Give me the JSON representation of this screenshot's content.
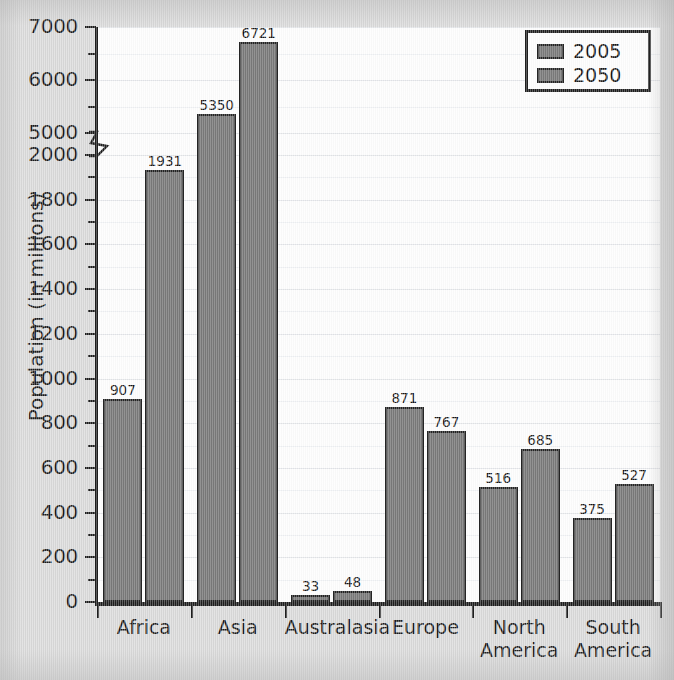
{
  "chart_data": {
    "type": "bar",
    "title": "",
    "xlabel": "",
    "ylabel": "Population (in millions)",
    "categories": [
      "Africa",
      "Asia",
      "Australasia",
      "Europe",
      "North America",
      "South America"
    ],
    "category_lines": [
      [
        "Africa"
      ],
      [
        "Asia"
      ],
      [
        "Australasia"
      ],
      [
        "Europe"
      ],
      [
        "North",
        "America"
      ],
      [
        "South",
        "America"
      ]
    ],
    "series": [
      {
        "name": "2005",
        "values": [
          907,
          5350,
          33,
          871,
          516,
          375
        ]
      },
      {
        "name": "2050",
        "values": [
          1931,
          6721,
          48,
          767,
          685,
          527
        ]
      }
    ],
    "legend": [
      "2005",
      "2050"
    ],
    "legend_position": "top-right",
    "grid": true,
    "broken_axis": true,
    "axis_break_between": [
      2000,
      5000
    ],
    "ylim_lower": [
      0,
      2000
    ],
    "ylim_upper": [
      5000,
      7000
    ],
    "ytick_labels": [
      "0",
      "200",
      "400",
      "600",
      "800",
      "1000",
      "1200",
      "1400",
      "1600",
      "1800",
      "2000",
      "5000",
      "6000",
      "7000"
    ],
    "ytick_values": [
      0,
      200,
      400,
      600,
      800,
      1000,
      1200,
      1400,
      1600,
      1800,
      2000,
      5000,
      6000,
      7000
    ],
    "minor_tick_step": 100,
    "bar_color": "#6f6f6f",
    "bar_border_color": "#242424",
    "grid_color": "#e2e4e8",
    "plot_background": "#fdfdfd",
    "page_background": "#d9d9d9",
    "axis_color": "#1d1d1d"
  }
}
